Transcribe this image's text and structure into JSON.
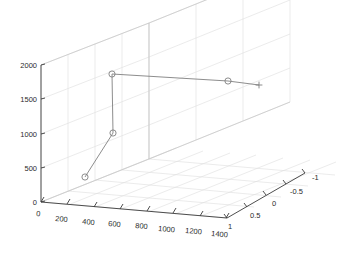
{
  "chart_data": {
    "type": "line",
    "title": "",
    "xlabel": "",
    "ylabel": "",
    "zlabel": "",
    "projection": "3d",
    "grid": true,
    "legend": null,
    "xlim": [
      0,
      1400
    ],
    "ylim": [
      -1,
      1
    ],
    "zlim": [
      0,
      2000
    ],
    "xticks": [
      "0",
      "200",
      "400",
      "600",
      "800",
      "1000",
      "1200",
      "1400"
    ],
    "xtick_values": [
      0,
      200,
      400,
      600,
      800,
      1000,
      1200,
      1400
    ],
    "yticks": [
      "1",
      "0.5",
      "0",
      "-0.5",
      "-1"
    ],
    "ytick_values": [
      1,
      0.5,
      0,
      -0.5,
      -1
    ],
    "zticks": [
      "0",
      "500",
      "1000",
      "1500",
      "2000"
    ],
    "ztick_values": [
      0,
      500,
      1000,
      1500,
      2000
    ],
    "series": [
      {
        "name": "path",
        "marker": "o",
        "end_marker": "+",
        "line_color": "#808080",
        "marker_color": "#808080",
        "x": [
          160,
          380,
          380,
          1120,
          1400
        ],
        "y": [
          1,
          1,
          1,
          1,
          1
        ],
        "z": [
          420,
          1040,
          1930,
          1840,
          1790
        ],
        "screen_points": [
          {
            "px": 85,
            "py": 177,
            "marker": "o"
          },
          {
            "px": 113,
            "py": 133,
            "marker": "o"
          },
          {
            "px": 112,
            "py": 74,
            "marker": "o"
          },
          {
            "px": 228,
            "py": 81,
            "marker": "o"
          },
          {
            "px": 259,
            "py": 85,
            "marker": "+"
          }
        ]
      }
    ],
    "colors": {
      "axis": "#3a3a3a",
      "grid": "#dcdcdc",
      "wall_edge": "#c8c8c8",
      "data_line": "#808080",
      "background": "#ffffff",
      "text": "#2b2b2b"
    }
  },
  "axes": {
    "z_tick_labels": [
      "2000",
      "1500",
      "1000",
      "500",
      "0"
    ],
    "x_tick_labels": [
      "0",
      "200",
      "400",
      "600",
      "800",
      "1000",
      "1200",
      "1400"
    ],
    "y_tick_labels": [
      "1",
      "0.5",
      "0",
      "-0.5",
      "-1"
    ]
  }
}
